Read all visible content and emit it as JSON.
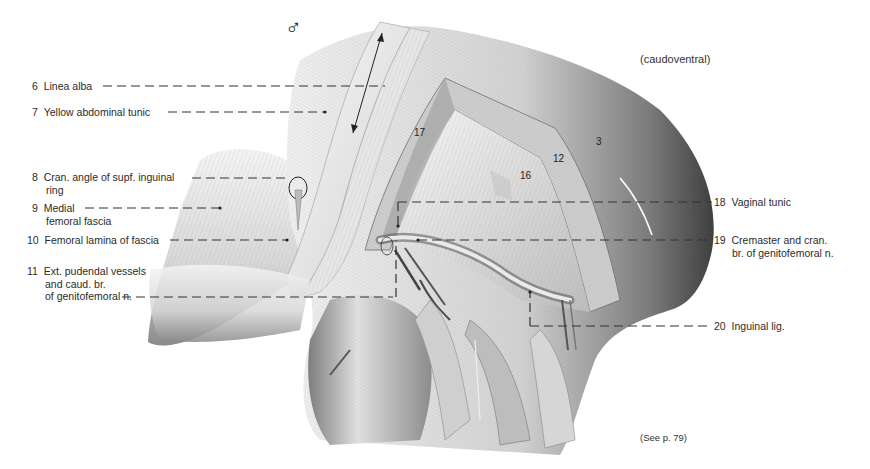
{
  "figure": {
    "symbol": "♂",
    "view_note": "(caudoventral)",
    "reference_note": "(See p. 79)"
  },
  "labels_left": [
    {
      "num": "6",
      "lines": [
        "Linea alba"
      ]
    },
    {
      "num": "7",
      "lines": [
        "Yellow abdominal tunic"
      ]
    },
    {
      "num": "8",
      "lines": [
        "Cran. angle of supf. inguinal",
        "ring"
      ]
    },
    {
      "num": "9",
      "lines": [
        "Medial",
        "femoral fascia"
      ]
    },
    {
      "num": "10",
      "lines": [
        "Femoral lamina of fascia"
      ]
    },
    {
      "num": "11",
      "lines": [
        "Ext. pudendal vessels",
        "and caud. br.",
        "of genitofemoral n."
      ]
    }
  ],
  "labels_right": [
    {
      "num": "18",
      "lines": [
        "Vaginal tunic"
      ]
    },
    {
      "num": "19",
      "lines": [
        "Cremaster and cran.",
        "br. of genitofemoral n."
      ]
    },
    {
      "num": "20",
      "lines": [
        "Inguinal lig."
      ]
    }
  ],
  "region_numbers": [
    "17",
    "16",
    "12",
    "3"
  ],
  "colors": {
    "ink": "#2b2b2b",
    "leader": "#333333",
    "background": "#ffffff"
  }
}
